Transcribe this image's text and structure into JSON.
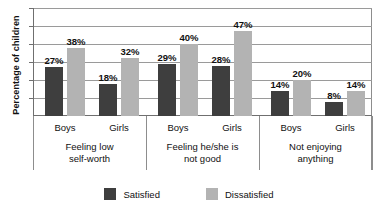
{
  "chart_data": {
    "type": "bar",
    "title": "",
    "xlabel": "",
    "ylabel": "Percentage of children",
    "ylim": [
      0,
      60
    ],
    "grid": true,
    "gridlines": [
      10,
      20,
      30,
      40,
      50,
      60
    ],
    "legend_position": "bottom",
    "categories": [
      "Boys",
      "Girls",
      "Boys",
      "Girls",
      "Boys",
      "Girls"
    ],
    "groups": [
      {
        "label_line1": "Feeling low",
        "label_line2": "self-worth",
        "bars": [
          {
            "category": "Boys",
            "series": "Satisfied",
            "value": 27,
            "label": "27%"
          },
          {
            "category": "Boys",
            "series": "Dissatisfied",
            "value": 38,
            "label": "38%"
          },
          {
            "category": "Girls",
            "series": "Satisfied",
            "value": 18,
            "label": "18%"
          },
          {
            "category": "Girls",
            "series": "Dissatisfied",
            "value": 32,
            "label": "32%"
          }
        ]
      },
      {
        "label_line1": "Feeling he/she is",
        "label_line2": "not good",
        "bars": [
          {
            "category": "Boys",
            "series": "Satisfied",
            "value": 29,
            "label": "29%"
          },
          {
            "category": "Boys",
            "series": "Dissatisfied",
            "value": 40,
            "label": "40%"
          },
          {
            "category": "Girls",
            "series": "Satisfied",
            "value": 28,
            "label": "28%"
          },
          {
            "category": "Girls",
            "series": "Dissatisfied",
            "value": 47,
            "label": "47%"
          }
        ]
      },
      {
        "label_line1": "Not enjoying",
        "label_line2": "anything",
        "bars": [
          {
            "category": "Boys",
            "series": "Satisfied",
            "value": 14,
            "label": "14%"
          },
          {
            "category": "Boys",
            "series": "Dissatisfied",
            "value": 20,
            "label": "20%"
          },
          {
            "category": "Girls",
            "series": "Satisfied",
            "value": 8,
            "label": "8%"
          },
          {
            "category": "Girls",
            "series": "Dissatisfied",
            "value": 14,
            "label": "14%"
          }
        ]
      }
    ],
    "series": [
      {
        "name": "Satisfied",
        "color": "#3e3e3e",
        "values": [
          27,
          18,
          29,
          28,
          14,
          8
        ]
      },
      {
        "name": "Dissatisfied",
        "color": "#b3b3b3",
        "values": [
          38,
          32,
          40,
          47,
          20,
          14
        ]
      }
    ]
  },
  "legend": {
    "items": [
      {
        "label": "Satisfied",
        "color": "#3e3e3e"
      },
      {
        "label": "Dissatisfied",
        "color": "#b3b3b3"
      }
    ]
  }
}
